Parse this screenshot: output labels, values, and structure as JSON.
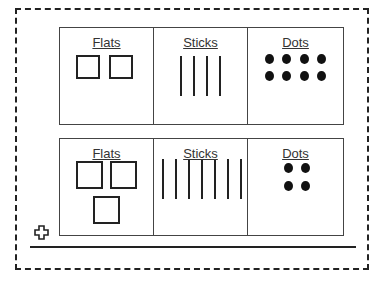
{
  "diagram": {
    "rows": [
      {
        "columns": [
          {
            "label": "Flats",
            "count": 2
          },
          {
            "label": "Sticks",
            "count": 4
          },
          {
            "label": "Dots",
            "count": 8
          }
        ]
      },
      {
        "columns": [
          {
            "label": "Flats",
            "count": 3
          },
          {
            "label": "Sticks",
            "count": 7
          },
          {
            "label": "Dots",
            "count": 4
          }
        ]
      }
    ],
    "operator_icon": "plus-icon"
  }
}
